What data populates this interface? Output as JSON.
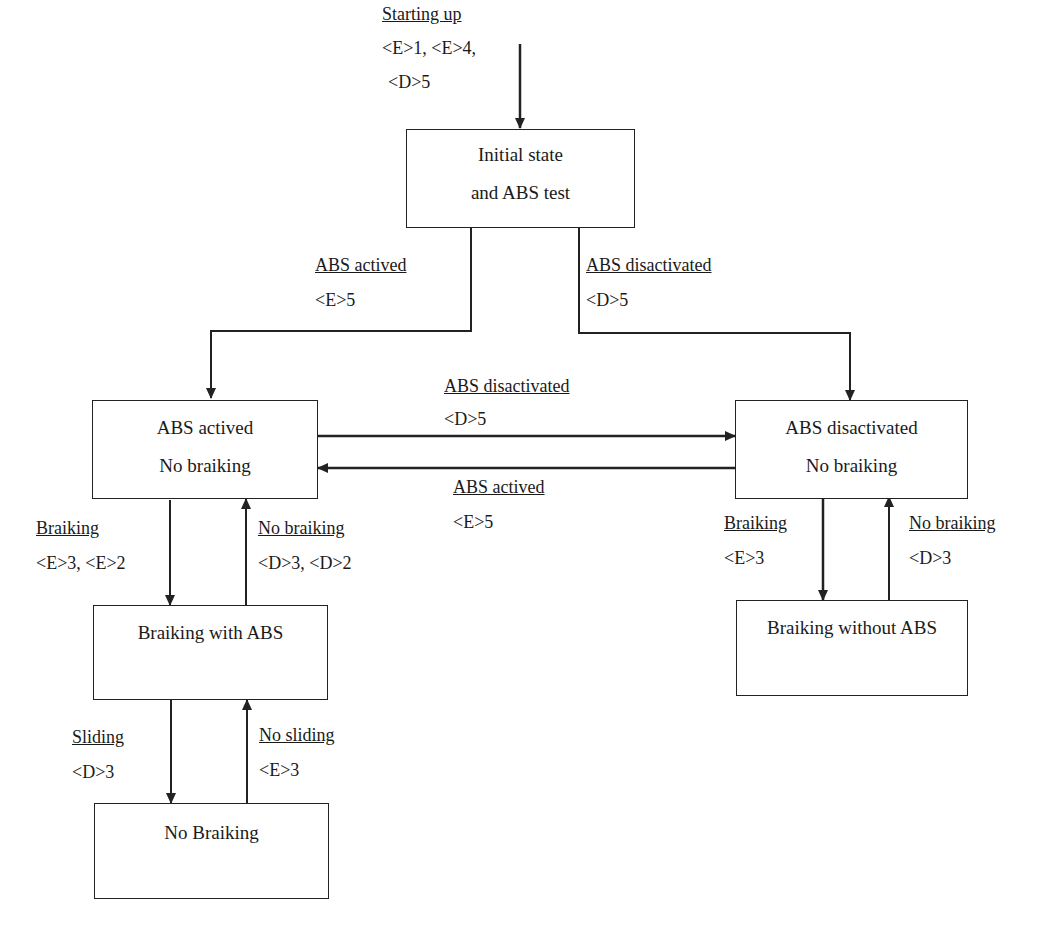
{
  "diagram": {
    "type": "state-transition",
    "states": [
      {
        "id": "initial",
        "lines": [
          "Initial state",
          "and ABS test"
        ]
      },
      {
        "id": "abs_on_idle",
        "lines": [
          "ABS actived",
          "No braiking"
        ]
      },
      {
        "id": "abs_off_idle",
        "lines": [
          "ABS disactivated",
          "No braiking"
        ]
      },
      {
        "id": "braking_abs",
        "lines": [
          "Braiking with ABS"
        ]
      },
      {
        "id": "braking_no_abs",
        "lines": [
          "Braiking without ABS"
        ]
      },
      {
        "id": "no_braking",
        "lines": [
          "No Braiking"
        ]
      }
    ],
    "transitions": [
      {
        "id": "start",
        "from": null,
        "to": "initial",
        "event": "Starting up",
        "condition": "<E>1, <E>4,",
        "condition2": "<D>5"
      },
      {
        "id": "init_to_on",
        "from": "initial",
        "to": "abs_on_idle",
        "event": "ABS actived",
        "condition": "<E>5"
      },
      {
        "id": "init_to_off",
        "from": "initial",
        "to": "abs_off_idle",
        "event": "ABS disactivated",
        "condition": "<D>5"
      },
      {
        "id": "on_to_off",
        "from": "abs_on_idle",
        "to": "abs_off_idle",
        "event": "ABS disactivated",
        "condition": "<D>5"
      },
      {
        "id": "off_to_on",
        "from": "abs_off_idle",
        "to": "abs_on_idle",
        "event": "ABS actived",
        "condition": "<E>5"
      },
      {
        "id": "on_brake",
        "from": "abs_on_idle",
        "to": "braking_abs",
        "event": "Braiking",
        "condition": "<E>3, <E>2"
      },
      {
        "id": "on_release",
        "from": "braking_abs",
        "to": "abs_on_idle",
        "event": "No braiking",
        "condition": "<D>3, <D>2"
      },
      {
        "id": "off_brake",
        "from": "abs_off_idle",
        "to": "braking_no_abs",
        "event": "Braiking",
        "condition": "<E>3"
      },
      {
        "id": "off_release",
        "from": "braking_no_abs",
        "to": "abs_off_idle",
        "event": "No braiking",
        "condition": "<D>3"
      },
      {
        "id": "slide",
        "from": "braking_abs",
        "to": "no_braking",
        "event": "Sliding",
        "condition": "<D>3"
      },
      {
        "id": "no_slide",
        "from": "no_braking",
        "to": "braking_abs",
        "event": "No sliding",
        "condition": "<E>3"
      }
    ]
  },
  "colors": {
    "line": "#222222",
    "background": "#ffffff",
    "text": "#1a1a1a"
  }
}
